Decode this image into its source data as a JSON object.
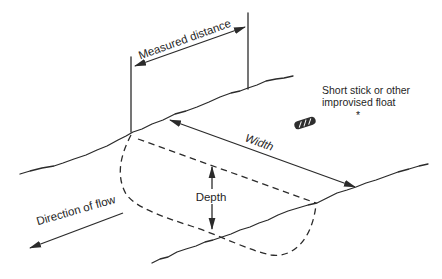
{
  "diagram": {
    "labels": {
      "measured_distance": "Measured distance",
      "width": "Width",
      "depth": "Depth",
      "direction_of_flow": "Direction of flow",
      "float_note_line1": "Short stick or other",
      "float_note_line2": "improvised float",
      "float_note_marker": "*"
    },
    "icons": {
      "float_stick": "float-stick-icon"
    },
    "colors": {
      "line": "#2b2b2b",
      "text": "#1f1f1f",
      "background": "#ffffff"
    }
  }
}
